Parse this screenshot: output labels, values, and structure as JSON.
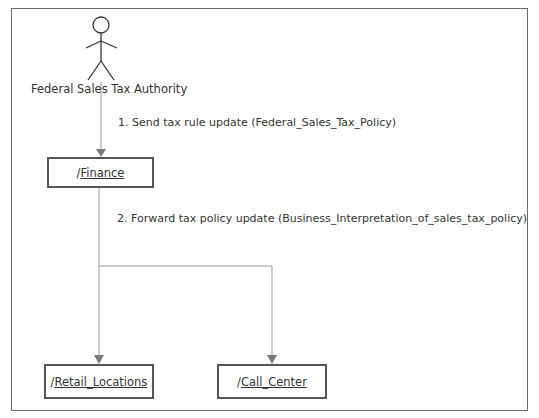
{
  "diagram": {
    "type": "communication",
    "actor": {
      "label": "Federal Sales Tax Authority",
      "icon": "stick-figure-actor-icon"
    },
    "objects": [
      {
        "id": "finance",
        "prefix": "/",
        "name": "Finance"
      },
      {
        "id": "retail",
        "prefix": "/",
        "name": "Retail_Locations"
      },
      {
        "id": "call_center",
        "prefix": "/",
        "name": "Call_Center"
      }
    ],
    "messages": [
      {
        "from": "Federal Sales Tax Authority",
        "to": "Finance",
        "label": "1. Send tax rule update (Federal_Sales_Tax_Policy)"
      },
      {
        "from": "Finance",
        "to": [
          "Retail_Locations",
          "Call_Center"
        ],
        "label": "2. Forward tax policy update (Business_Interpretation_of_sales_tax_policy)"
      }
    ],
    "colors": {
      "frame": "#6b6b6b",
      "box_border": "#555555",
      "connector": "#9a9a9a",
      "arrowhead": "#7a7a7a",
      "text": "#333333"
    }
  }
}
